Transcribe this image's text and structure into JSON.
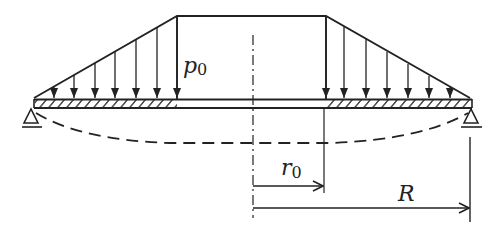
{
  "diagram": {
    "type": "beam-loading-schematic",
    "labels": {
      "load_intensity": "p",
      "load_intensity_sub": "0",
      "inner_radius": "r",
      "inner_radius_sub": "0",
      "outer_radius": "R"
    },
    "colors": {
      "stroke": "#222222",
      "background": "#ffffff"
    },
    "elements": {
      "load_profile": "trapezoid-with-void-center",
      "left_arrows_count": 7,
      "right_arrows_count": 7,
      "supports": [
        "left-pin",
        "right-pin"
      ],
      "deflection_curve": "dashed",
      "center_axis": "dash-dot"
    }
  }
}
